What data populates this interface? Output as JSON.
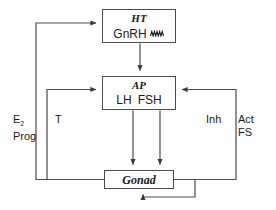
{
  "diagram": {
    "type": "flow-diagram",
    "colors": {
      "line": "#4a4a4a",
      "text": "#1a1a1a",
      "background": "#ffffff"
    },
    "nodes": [
      {
        "id": "ht",
        "title": "HT",
        "sub": "GnRH",
        "icon": "pulsatile-wave-icon"
      },
      {
        "id": "ap",
        "title": "AP",
        "sub_left": "LH",
        "sub_right": "FSH"
      },
      {
        "id": "gonad",
        "title": "Gonad"
      }
    ],
    "labels": {
      "e2_line1": "E",
      "e2_sub": "2",
      "e2_line2": "Prog",
      "t": "T",
      "inh": "Inh",
      "act_line1": "Act",
      "act_line2": "FS"
    },
    "edges": [
      {
        "from": "ht",
        "to": "ap",
        "label": ""
      },
      {
        "from": "ap",
        "to": "gonad",
        "label": "LH"
      },
      {
        "from": "ap",
        "to": "gonad",
        "label": "FSH"
      },
      {
        "from": "gonad",
        "to": "ht",
        "label": "E2 Prog"
      },
      {
        "from": "gonad",
        "to": "ap",
        "label": "T"
      },
      {
        "from": "gonad",
        "to": "ap",
        "label": "Inh Act FS"
      },
      {
        "from": "gonad",
        "to": "gonad",
        "label": ""
      }
    ]
  }
}
